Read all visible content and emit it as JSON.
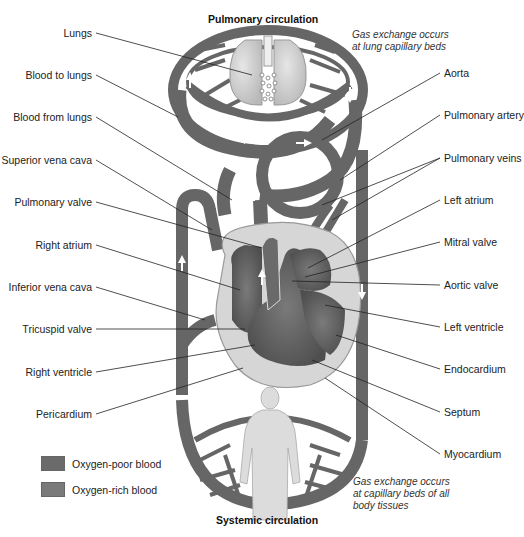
{
  "titles": {
    "top": "Pulmonary circulation",
    "bottom": "Systemic circulation"
  },
  "notes": {
    "top": "Gas exchange occurs\nat lung capillary beds",
    "bottom": "Gas exchange occurs\nat capillary beds of all\nbody tissues"
  },
  "labels_left": [
    {
      "text": "Lungs",
      "x": 92,
      "y": 28
    },
    {
      "text": "Blood to lungs",
      "x": 92,
      "y": 70
    },
    {
      "text": "Blood from lungs",
      "x": 92,
      "y": 112
    },
    {
      "text": "Superior vena cava",
      "x": 92,
      "y": 155
    },
    {
      "text": "Pulmonary valve",
      "x": 92,
      "y": 197
    },
    {
      "text": "Right atrium",
      "x": 92,
      "y": 240
    },
    {
      "text": "Inferior vena cava",
      "x": 92,
      "y": 282
    },
    {
      "text": "Tricuspid valve",
      "x": 92,
      "y": 324
    },
    {
      "text": "Right ventricle",
      "x": 92,
      "y": 367
    },
    {
      "text": "Pericardium",
      "x": 92,
      "y": 409
    }
  ],
  "labels_right": [
    {
      "text": "Aorta",
      "x": 444,
      "y": 68
    },
    {
      "text": "Pulmonary artery",
      "x": 444,
      "y": 110
    },
    {
      "text": "Pulmonary veins",
      "x": 444,
      "y": 153
    },
    {
      "text": "Left atrium",
      "x": 444,
      "y": 195
    },
    {
      "text": "Mitral valve",
      "x": 444,
      "y": 237
    },
    {
      "text": "Aortic valve",
      "x": 444,
      "y": 280
    },
    {
      "text": "Left ventricle",
      "x": 444,
      "y": 322
    },
    {
      "text": "Endocardium",
      "x": 444,
      "y": 364
    },
    {
      "text": "Septum",
      "x": 444,
      "y": 407
    },
    {
      "text": "Myocardium",
      "x": 444,
      "y": 449
    }
  ],
  "legend": [
    {
      "label": "Oxygen-poor blood",
      "color": "#6b6b6b"
    },
    {
      "label": "Oxygen-rich blood",
      "color": "#7a7a7a"
    }
  ],
  "colors": {
    "vessel": "#6a6a6a",
    "vessel_dark": "#4a4a4a",
    "heart_outer": "#d8d8d8",
    "chamber": "#5c5c5c",
    "lung": "#cfcfcf",
    "body": "#dcdcdc"
  }
}
